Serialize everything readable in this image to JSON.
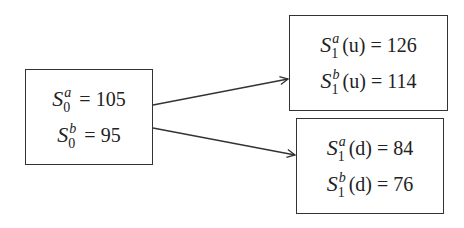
{
  "diagram": {
    "type": "binomial-tree",
    "nodes": {
      "initial": {
        "lines": [
          {
            "symbol": "S",
            "sup": "a",
            "sub": "0",
            "arg": "",
            "value": "105"
          },
          {
            "symbol": "S",
            "sup": "b",
            "sub": "0",
            "arg": "",
            "value": "95"
          }
        ]
      },
      "up": {
        "lines": [
          {
            "symbol": "S",
            "sup": "a",
            "sub": "1",
            "arg": "(u)",
            "value": "126"
          },
          {
            "symbol": "S",
            "sup": "b",
            "sub": "1",
            "arg": "(u)",
            "value": "114"
          }
        ]
      },
      "down": {
        "lines": [
          {
            "symbol": "S",
            "sup": "a",
            "sub": "1",
            "arg": "(d)",
            "value": "84"
          },
          {
            "symbol": "S",
            "sup": "b",
            "sub": "1",
            "arg": "(d)",
            "value": "76"
          }
        ]
      }
    },
    "edges": [
      {
        "from": "initial",
        "to": "up"
      },
      {
        "from": "initial",
        "to": "down"
      }
    ],
    "equals": "="
  }
}
